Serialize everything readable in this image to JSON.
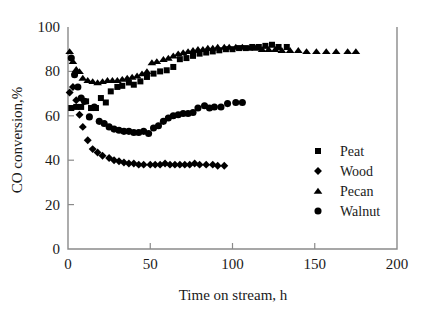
{
  "chart_data": {
    "type": "scatter",
    "title": "",
    "xlabel": "Time on stream, h",
    "ylabel": "CO conversion,%",
    "xlim": [
      0,
      200
    ],
    "ylim": [
      0,
      100
    ],
    "xticks": [
      0,
      50,
      100,
      150,
      200
    ],
    "yticks": [
      0,
      20,
      40,
      60,
      80,
      100
    ],
    "grid": false,
    "legend_position": "right-middle",
    "series": [
      {
        "name": "Peat",
        "marker": "square",
        "color": "#000000",
        "points": [
          [
            2,
            63.5
          ],
          [
            5,
            64.0
          ],
          [
            8,
            64.0
          ],
          [
            11,
            66.5
          ],
          [
            14,
            63.5
          ],
          [
            17,
            63.5
          ],
          [
            20,
            68.0
          ],
          [
            23,
            66.0
          ],
          [
            26,
            71.0
          ],
          [
            30,
            73.0
          ],
          [
            33,
            73.5
          ],
          [
            37,
            75.0
          ],
          [
            40,
            74.0
          ],
          [
            44,
            75.5
          ],
          [
            48,
            77.5
          ],
          [
            52,
            79.0
          ],
          [
            56,
            80.0
          ],
          [
            60,
            80.5
          ],
          [
            64,
            82.0
          ],
          [
            68,
            85.5
          ],
          [
            72,
            86.0
          ],
          [
            76,
            87.0
          ],
          [
            80,
            88.0
          ],
          [
            84,
            88.5
          ],
          [
            88,
            89.0
          ],
          [
            92,
            89.5
          ],
          [
            96,
            90.0
          ],
          [
            100,
            90.0
          ],
          [
            104,
            90.5
          ],
          [
            108,
            90.5
          ],
          [
            112,
            91.0
          ],
          [
            116,
            91.0
          ],
          [
            120,
            91.5
          ],
          [
            124,
            92.0
          ],
          [
            128,
            91.0
          ],
          [
            133,
            91.0
          ]
        ]
      },
      {
        "name": "Wood",
        "marker": "diamond",
        "color": "#000000",
        "points": [
          [
            1,
            70.5
          ],
          [
            3,
            73.0
          ],
          [
            5,
            67.0
          ],
          [
            7,
            60.5
          ],
          [
            9,
            55.0
          ],
          [
            12,
            49.0
          ],
          [
            15,
            45.0
          ],
          [
            18,
            43.5
          ],
          [
            21,
            42.0
          ],
          [
            25,
            41.0
          ],
          [
            28,
            40.0
          ],
          [
            31,
            39.5
          ],
          [
            34,
            39.0
          ],
          [
            37,
            38.5
          ],
          [
            40,
            38.5
          ],
          [
            43,
            38.0
          ],
          [
            46,
            38.0
          ],
          [
            50,
            38.0
          ],
          [
            53,
            38.0
          ],
          [
            56,
            38.0
          ],
          [
            59,
            38.5
          ],
          [
            62,
            38.0
          ],
          [
            65,
            38.0
          ],
          [
            68,
            38.0
          ],
          [
            71,
            38.0
          ],
          [
            74,
            38.0
          ],
          [
            77,
            38.5
          ],
          [
            80,
            38.0
          ],
          [
            84,
            38.0
          ],
          [
            88,
            38.0
          ],
          [
            91,
            37.5
          ],
          [
            95,
            37.5
          ]
        ]
      },
      {
        "name": "Pecan",
        "marker": "triangle",
        "color": "#000000",
        "points": [
          [
            1,
            89.0
          ],
          [
            3,
            84.5
          ],
          [
            5,
            81.0
          ],
          [
            7,
            80.0
          ],
          [
            9,
            77.0
          ],
          [
            12,
            76.0
          ],
          [
            15,
            75.5
          ],
          [
            18,
            75.0
          ],
          [
            21,
            75.5
          ],
          [
            24,
            76.0
          ],
          [
            27,
            76.0
          ],
          [
            30,
            76.0
          ],
          [
            33,
            76.5
          ],
          [
            36,
            77.0
          ],
          [
            39,
            77.5
          ],
          [
            42,
            78.0
          ],
          [
            45,
            79.0
          ],
          [
            48,
            80.0
          ],
          [
            51,
            84.0
          ],
          [
            54,
            84.5
          ],
          [
            58,
            85.5
          ],
          [
            61,
            86.0
          ],
          [
            64,
            87.0
          ],
          [
            67,
            88.0
          ],
          [
            70,
            88.5
          ],
          [
            73,
            89.0
          ],
          [
            76,
            89.5
          ],
          [
            79,
            90.0
          ],
          [
            82,
            90.0
          ],
          [
            85,
            90.5
          ],
          [
            88,
            90.5
          ],
          [
            91,
            91.0
          ],
          [
            95,
            91.0
          ],
          [
            98,
            91.0
          ],
          [
            102,
            91.0
          ],
          [
            106,
            91.0
          ],
          [
            110,
            90.5
          ],
          [
            114,
            90.5
          ],
          [
            118,
            90.0
          ],
          [
            122,
            90.0
          ],
          [
            126,
            90.0
          ],
          [
            130,
            89.5
          ],
          [
            135,
            89.5
          ],
          [
            140,
            89.5
          ],
          [
            145,
            89.0
          ],
          [
            151,
            89.0
          ],
          [
            157,
            89.0
          ],
          [
            163,
            89.0
          ],
          [
            170,
            89.0
          ],
          [
            175,
            89.0
          ]
        ]
      },
      {
        "name": "Walnut",
        "marker": "circle",
        "color": "#000000",
        "points": [
          [
            2,
            86.0
          ],
          [
            4,
            78.5
          ],
          [
            6,
            73.0
          ],
          [
            8,
            68.0
          ],
          [
            10,
            66.5
          ],
          [
            13,
            59.5
          ],
          [
            16,
            64.0
          ],
          [
            19,
            57.5
          ],
          [
            22,
            56.5
          ],
          [
            25,
            55.0
          ],
          [
            28,
            54.0
          ],
          [
            31,
            53.5
          ],
          [
            34,
            53.0
          ],
          [
            37,
            53.0
          ],
          [
            40,
            52.5
          ],
          [
            43,
            52.5
          ],
          [
            46,
            53.0
          ],
          [
            49,
            52.0
          ],
          [
            52,
            54.5
          ],
          [
            55,
            55.5
          ],
          [
            58,
            57.5
          ],
          [
            61,
            59.0
          ],
          [
            64,
            60.0
          ],
          [
            67,
            60.5
          ],
          [
            70,
            61.0
          ],
          [
            73,
            61.0
          ],
          [
            76,
            61.5
          ],
          [
            79,
            63.5
          ],
          [
            83,
            64.5
          ],
          [
            86,
            63.5
          ],
          [
            89,
            64.0
          ],
          [
            93,
            64.0
          ],
          [
            97,
            65.5
          ],
          [
            102,
            66.0
          ],
          [
            106,
            66.0
          ]
        ]
      }
    ]
  },
  "legend": {
    "entries": [
      {
        "label": "Peat",
        "marker": "square"
      },
      {
        "label": "Wood",
        "marker": "diamond"
      },
      {
        "label": "Pecan",
        "marker": "triangle"
      },
      {
        "label": "Walnut",
        "marker": "circle"
      }
    ]
  },
  "axes": {
    "x_tick_labels": [
      "0",
      "50",
      "100",
      "150",
      "200"
    ],
    "y_tick_labels": [
      "0",
      "20",
      "40",
      "60",
      "80",
      "100"
    ]
  },
  "colors": {
    "marker": "#000000",
    "axis": "#8a8a8a",
    "text": "#1a1a1a",
    "background": "#ffffff"
  }
}
